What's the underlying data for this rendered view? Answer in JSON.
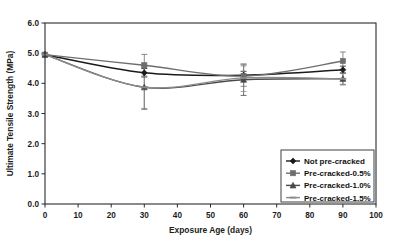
{
  "chart_data": {
    "type": "line",
    "title": "",
    "subtitle": "",
    "xlabel": "Exposure Age (days)",
    "ylabel": "Ultimate Tensile Strength (MPa)",
    "xlim": [
      0,
      100
    ],
    "ylim": [
      0.0,
      6.0
    ],
    "xticks": [
      0,
      10,
      20,
      30,
      40,
      50,
      60,
      70,
      80,
      90,
      100
    ],
    "xtick_labels": [
      "0",
      "10",
      "20",
      "30",
      "40",
      "50",
      "60",
      "70",
      "80",
      "90",
      "100"
    ],
    "yticks": [
      0.0,
      1.0,
      2.0,
      3.0,
      4.0,
      5.0,
      6.0
    ],
    "ytick_labels": [
      "0.0",
      "1.0",
      "2.0",
      "3.0",
      "4.0",
      "5.0",
      "6.0"
    ],
    "grid": false,
    "legend_position": "lower-right",
    "x": [
      0,
      30,
      60,
      90
    ],
    "series": [
      {
        "name": "Not pre-cracked",
        "marker": "diamond",
        "color": "#1a1a1a",
        "values": [
          4.95,
          4.35,
          4.27,
          4.45
        ],
        "errors": [
          0.0,
          0.14,
          0.13,
          0.12
        ]
      },
      {
        "name": "Pre-cracked-0.5%",
        "marker": "square",
        "color": "#6e6e6e",
        "values": [
          4.95,
          4.6,
          4.24,
          4.74
        ],
        "errors": [
          0.0,
          0.36,
          0.34,
          0.3
        ]
      },
      {
        "name": "Pre-cracked-1.0%",
        "marker": "triangle",
        "color": "#4a4a4a",
        "values": [
          4.95,
          3.87,
          4.12,
          4.15
        ],
        "errors": [
          0.0,
          0.73,
          0.52,
          0.2
        ]
      },
      {
        "name": "Pre-cracked-1.5%",
        "marker": "dash",
        "color": "#8c8c8c",
        "values": [
          4.95,
          3.87,
          4.18,
          4.15
        ],
        "errors": [
          0.0,
          0.7,
          0.45,
          0.18
        ]
      }
    ],
    "legend_entries": [
      "Not pre-cracked",
      "Pre-cracked-0.5%",
      "Pre-cracked-1.0%",
      "Pre-cracked-1.5%"
    ]
  },
  "colors": {
    "background": "#ffffff",
    "frame": "#2b2b2b",
    "text": "#1c1c1c"
  }
}
